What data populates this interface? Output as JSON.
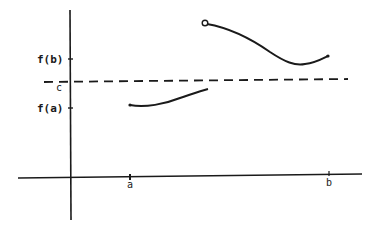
{
  "diagram": {
    "type": "intermediate-value-theorem-counterexample",
    "colors": {
      "ink": "#1a1a1a",
      "background": "#ffffff"
    },
    "y_axis": {
      "ticks": [
        {
          "label": "f(b)",
          "y": 59
        },
        {
          "label": "c",
          "y": 81
        },
        {
          "label": "f(a)",
          "y": 108
        }
      ]
    },
    "x_axis": {
      "ticks": [
        {
          "label": "a",
          "x": 130
        },
        {
          "label": "b",
          "x": 329
        }
      ]
    },
    "dashed_line": {
      "label": "c",
      "description": "horizontal level c between f(a) and f(b)"
    },
    "curves": [
      {
        "name": "lower-segment",
        "start": "filled point at (a, f(a))",
        "end": "jump discontinuity"
      },
      {
        "name": "upper-segment",
        "start": "open circle",
        "end": "filled point at (b, f(b))"
      }
    ]
  }
}
